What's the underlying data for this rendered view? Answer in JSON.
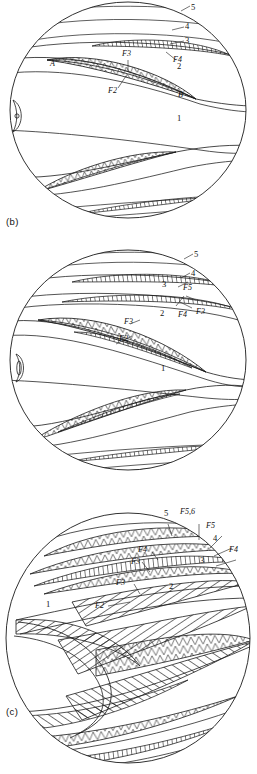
{
  "figure": {
    "type": "fold-interference-stereogram-set",
    "panels": [
      {
        "id": "b",
        "caption": "(b)",
        "pole_marker": "O",
        "layer_labels": [
          "5",
          "4",
          "3",
          "2",
          "1"
        ],
        "fold_labels": [
          "F4",
          "F3",
          "F2"
        ],
        "point_labels": [
          "A",
          "B"
        ]
      },
      {
        "id": "c",
        "caption": "(c)",
        "pole_marker": "O",
        "layer_labels": [
          "5",
          "4",
          "3",
          "2",
          "1"
        ],
        "fold_labels": [
          "F5",
          "F4",
          "F3",
          "F3",
          "F2"
        ]
      },
      {
        "id": "d",
        "caption": "(d)",
        "pole_marker": "",
        "layer_labels": [
          "5",
          "4",
          "3",
          "2",
          "1"
        ],
        "fold_labels": [
          "F5,6",
          "F5",
          "F4",
          "F4",
          "F3",
          "F3",
          "F2"
        ]
      }
    ]
  },
  "panel_b": {
    "caption": "(b)",
    "l5": "5",
    "l4": "4",
    "l3": "3",
    "l2": "2",
    "l1": "1",
    "f4": "F4",
    "f3": "F3",
    "f2": "F2",
    "pt_a": "A",
    "pt_b": "B",
    "pole": "O"
  },
  "panel_c": {
    "caption": "(c)",
    "l5": "5",
    "l4": "4",
    "l3": "3",
    "l2": "2",
    "l1": "1",
    "f5": "F5",
    "f4": "F4",
    "f3_right": "F3",
    "f3_inner": "F3",
    "f2": "F2",
    "pole": "O"
  },
  "panel_d": {
    "caption": "(d)",
    "l5": "5",
    "l4": "4",
    "l3": "3",
    "l2": "2",
    "l1": "1",
    "f56": "F5,6",
    "f5": "F5",
    "f4_right": "F4",
    "f4_inner": "F4",
    "f3_upper": "F3",
    "f3_mid": "F3",
    "f2": "F2"
  },
  "style": {
    "stroke": "#1a1a1a",
    "background": "#ffffff"
  }
}
